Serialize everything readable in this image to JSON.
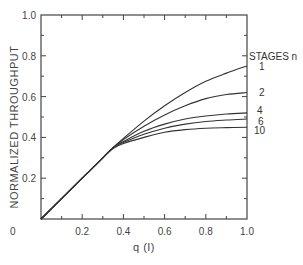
{
  "chart_data": {
    "type": "line",
    "title": "",
    "xlabel": "q (I)",
    "ylabel": "NORMALIZED THROUGHPUT",
    "xlim": [
      0,
      1.0
    ],
    "ylim": [
      0,
      1.0
    ],
    "xticks": [
      "0",
      "0.2",
      "0.4",
      "0.6",
      "0.8",
      "1.0"
    ],
    "yticks": [
      "0.2",
      "0.4",
      "0.6",
      "0.8",
      "1.0"
    ],
    "grid": false,
    "legend_title": "STAGES n",
    "legend_position": "right, inline labels at curve ends",
    "x": [
      0,
      0.1,
      0.2,
      0.3,
      0.35,
      0.4,
      0.5,
      0.6,
      0.7,
      0.8,
      0.9,
      1.0
    ],
    "series": [
      {
        "name": "1",
        "values": [
          0,
          0.1,
          0.2,
          0.3,
          0.35,
          0.395,
          0.48,
          0.555,
          0.62,
          0.675,
          0.715,
          0.75
        ]
      },
      {
        "name": "2",
        "values": [
          0,
          0.1,
          0.2,
          0.3,
          0.35,
          0.39,
          0.455,
          0.51,
          0.555,
          0.59,
          0.61,
          0.62
        ]
      },
      {
        "name": "4",
        "values": [
          0,
          0.1,
          0.2,
          0.3,
          0.35,
          0.38,
          0.43,
          0.465,
          0.49,
          0.505,
          0.515,
          0.52
        ]
      },
      {
        "name": "6",
        "values": [
          0,
          0.1,
          0.2,
          0.3,
          0.35,
          0.375,
          0.415,
          0.445,
          0.465,
          0.478,
          0.485,
          0.49
        ]
      },
      {
        "name": "10",
        "values": [
          0,
          0.1,
          0.2,
          0.3,
          0.345,
          0.37,
          0.4,
          0.425,
          0.438,
          0.445,
          0.448,
          0.45
        ]
      }
    ]
  }
}
